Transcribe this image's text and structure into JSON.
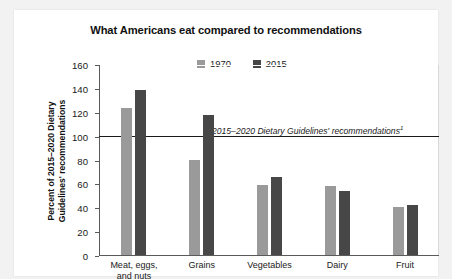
{
  "chart_data": {
    "type": "bar",
    "title": "What Americans eat compared to recommendations",
    "xlabel": "",
    "ylabel": "Percent of 2015–2020 Dietary Guidelines' recommendations",
    "ylabel_line1": "Percent of 2015–2020 Dietary",
    "ylabel_line2": "Guidelines' recommendations",
    "categories": [
      "Meat, eggs, and nuts",
      "Grains",
      "Vegetables",
      "Dairy",
      "Fruit"
    ],
    "category_lines": [
      [
        "Meat, eggs,",
        "and nuts"
      ],
      [
        "Grains"
      ],
      [
        "Vegetables"
      ],
      [
        "Dairy"
      ],
      [
        "Fruit"
      ]
    ],
    "series": [
      {
        "name": "1970",
        "color": "#9a9a9a",
        "values": [
          123,
          80,
          59,
          58,
          40
        ]
      },
      {
        "name": "2015",
        "color": "#474747",
        "values": [
          138,
          117,
          65,
          54,
          42
        ]
      }
    ],
    "ylim": [
      0,
      160
    ],
    "yticks": [
      0,
      20,
      40,
      60,
      80,
      100,
      120,
      140,
      160
    ],
    "ytick_labels": [
      "0",
      "20",
      "40",
      "60",
      "80",
      "100",
      "120",
      "140",
      "160"
    ],
    "grid": false,
    "legend_position": "top-center",
    "annotations": [
      {
        "text": "2015–2020 Dietary Guidelines' recommendations",
        "footnote_marker": "1",
        "value": 100,
        "style": "italic",
        "line": "horizontal reference line at 100 percent"
      }
    ],
    "colors": {
      "series_1970": "#9a9a9a",
      "series_2015": "#474747",
      "reference_line": "#1a1a1a",
      "axis": "#5a5a5a",
      "card_background": "#ffffff",
      "page_background": "#f2f2f2",
      "text": "#1a1a1a"
    }
  }
}
